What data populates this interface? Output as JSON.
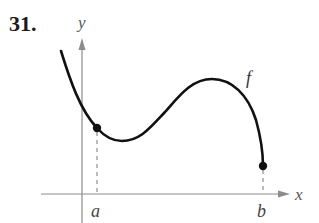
{
  "problem": {
    "number": "31."
  },
  "axes": {
    "x_label": "x",
    "y_label": "y",
    "axis_color": "#8c8c8c"
  },
  "function": {
    "label": "f",
    "curve_color": "#111111"
  },
  "points": [
    {
      "label": "a",
      "type": "closed-endpoint"
    },
    {
      "label": "b",
      "type": "closed-endpoint"
    }
  ]
}
